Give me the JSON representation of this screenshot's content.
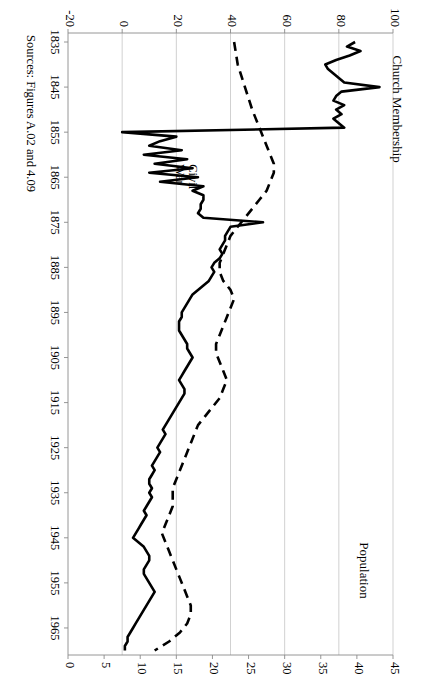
{
  "figure": {
    "source_note": "Sources: Figures A.02 and 4.09",
    "series_labels": {
      "left": "Church Membership",
      "right": "Population"
    },
    "annotations": [
      {
        "name": "civil-war",
        "line1": "Civil",
        "line2": "War",
        "year": 1863,
        "value": 30
      }
    ]
  },
  "chart_data": {
    "type": "line",
    "title": "",
    "xlabel": "",
    "ylabel": "Church Membership",
    "y2label": "Population",
    "xlim": [
      1833,
      1971
    ],
    "ylim": [
      -20,
      100
    ],
    "y2lim": [
      0,
      45
    ],
    "grid": true,
    "legend": "inline-labels",
    "xticks": [
      1835,
      1845,
      1855,
      1865,
      1875,
      1885,
      1895,
      1905,
      1915,
      1925,
      1935,
      1945,
      1955,
      1965
    ],
    "yticks": [
      -20,
      0,
      20,
      40,
      60,
      80,
      100
    ],
    "y2ticks": [
      0,
      5,
      10,
      15,
      20,
      25,
      30,
      35,
      40,
      45
    ],
    "series": [
      {
        "name": "Church Membership",
        "style": "solid",
        "axis": "left",
        "color": "#000000",
        "x": [
          1835,
          1836,
          1837,
          1838,
          1839,
          1840,
          1841,
          1842,
          1843,
          1844,
          1845,
          1846,
          1847,
          1848,
          1849,
          1850,
          1851,
          1852,
          1853,
          1854,
          1855,
          1856,
          1857,
          1858,
          1859,
          1860,
          1861,
          1862,
          1863,
          1864,
          1865,
          1866,
          1867,
          1868,
          1869,
          1870,
          1871,
          1872,
          1873,
          1874,
          1875,
          1876,
          1877,
          1878,
          1879,
          1880,
          1881,
          1882,
          1883,
          1884,
          1885,
          1886,
          1887,
          1888,
          1889,
          1890,
          1891,
          1892,
          1893,
          1894,
          1895,
          1896,
          1897,
          1898,
          1899,
          1900,
          1901,
          1902,
          1903,
          1904,
          1905,
          1906,
          1907,
          1908,
          1909,
          1910,
          1911,
          1912,
          1913,
          1914,
          1915,
          1916,
          1917,
          1918,
          1919,
          1920,
          1921,
          1922,
          1923,
          1924,
          1925,
          1926,
          1927,
          1928,
          1929,
          1930,
          1931,
          1932,
          1933,
          1934,
          1935,
          1936,
          1937,
          1938,
          1939,
          1940,
          1941,
          1942,
          1943,
          1944,
          1945,
          1946,
          1947,
          1948,
          1949,
          1950,
          1951,
          1952,
          1953,
          1954,
          1955,
          1956,
          1957,
          1958,
          1959,
          1960,
          1961,
          1962,
          1963,
          1964,
          1965,
          1966,
          1967,
          1968,
          1969,
          1970
        ],
        "y": [
          86,
          83,
          88,
          84,
          79,
          75,
          76,
          78,
          80,
          82,
          95,
          81,
          79,
          78,
          82,
          79,
          81,
          78,
          80,
          82,
          0,
          20,
          14,
          10,
          22,
          8,
          24,
          12,
          26,
          10,
          28,
          14,
          30,
          26,
          30,
          30,
          29,
          29,
          28,
          30,
          52,
          40,
          39,
          38,
          38,
          37,
          36,
          37,
          36,
          34,
          33,
          34,
          33,
          32,
          30,
          28,
          26,
          25,
          24,
          23,
          22,
          22,
          21,
          21,
          21,
          22,
          23,
          24,
          24,
          25,
          26,
          25,
          24,
          23,
          22,
          21,
          22,
          23,
          23,
          22,
          21,
          20,
          19,
          18,
          17,
          16,
          15,
          16,
          15,
          14,
          13,
          14,
          13,
          12,
          11,
          12,
          11,
          10,
          10,
          11,
          10,
          11,
          10,
          9,
          8,
          9,
          8,
          7,
          6,
          5,
          4,
          6,
          8,
          9,
          10,
          10,
          9,
          8,
          8,
          9,
          10,
          11,
          12,
          11,
          10,
          9,
          8,
          7,
          6,
          5,
          4,
          3,
          2,
          2,
          1,
          1
        ]
      },
      {
        "name": "Population",
        "style": "dashed",
        "axis": "right",
        "color": "#000000",
        "x": [
          1835,
          1840,
          1845,
          1850,
          1852,
          1854,
          1856,
          1858,
          1860,
          1862,
          1864,
          1866,
          1868,
          1870,
          1872,
          1874,
          1876,
          1878,
          1880,
          1882,
          1884,
          1886,
          1888,
          1890,
          1892,
          1894,
          1896,
          1898,
          1900,
          1902,
          1904,
          1906,
          1908,
          1910,
          1912,
          1914,
          1916,
          1918,
          1920,
          1922,
          1924,
          1926,
          1928,
          1930,
          1932,
          1934,
          1936,
          1938,
          1940,
          1942,
          1944,
          1946,
          1948,
          1950,
          1952,
          1954,
          1956,
          1958,
          1960,
          1962,
          1964,
          1966,
          1968,
          1970
        ],
        "y": [
          23.0,
          23.5,
          24.5,
          25.5,
          26.0,
          26.5,
          27.0,
          27.5,
          28.0,
          28.5,
          28.5,
          28.0,
          27.5,
          26.5,
          25.5,
          24.5,
          23.5,
          22.5,
          22.0,
          21.5,
          21.0,
          21.0,
          21.5,
          22.5,
          23.0,
          22.5,
          22.0,
          21.5,
          21.0,
          20.5,
          20.5,
          21.0,
          21.5,
          22.0,
          21.5,
          21.0,
          20.0,
          19.0,
          18.0,
          17.5,
          17.0,
          16.5,
          16.0,
          15.5,
          15.0,
          14.5,
          14.5,
          14.5,
          14.0,
          13.5,
          13.0,
          13.5,
          14.0,
          14.5,
          15.0,
          15.5,
          16.0,
          16.5,
          17.0,
          17.0,
          16.5,
          15.5,
          14.0,
          12.0
        ]
      }
    ]
  }
}
